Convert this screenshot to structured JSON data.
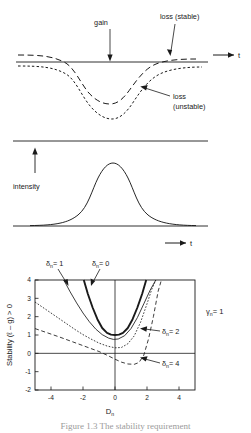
{
  "figure": {
    "caption": "Figure 1.3  The stability requirement",
    "panels": [
      "gain-loss-panel",
      "intensity-panel",
      "stability-panel"
    ]
  },
  "top_panel": {
    "name": "gain-loss-diagram",
    "axis_label_t": "t",
    "annotations": [
      {
        "id": "gain",
        "text": "gain"
      },
      {
        "id": "loss-stable",
        "text": "loss (stable)"
      },
      {
        "id": "loss-unstable-line1",
        "text": "loss"
      },
      {
        "id": "loss-unstable-line2",
        "text": "(unstable)"
      }
    ],
    "curves": [
      {
        "name": "gain-line",
        "style": "solid"
      },
      {
        "name": "loss-stable-curve",
        "style": "dashed"
      },
      {
        "name": "loss-unstable-curve",
        "style": "dotted"
      }
    ]
  },
  "mid_panel": {
    "name": "intensity-pulse-diagram",
    "y_axis_label": "intensity",
    "x_axis_label": "t",
    "curve": {
      "name": "intensity-pulse",
      "shape": "gaussian"
    }
  },
  "chart_data": {
    "type": "line",
    "title": "",
    "xlabel": "D_n",
    "ylabel": "Stability  (ℓ – g) > 0",
    "xlim": [
      -5,
      5
    ],
    "ylim": [
      -2,
      4
    ],
    "xticks": [
      -4,
      -2,
      0,
      2,
      4
    ],
    "yticks": [
      4,
      3,
      2,
      1,
      0,
      -1,
      -2
    ],
    "grid": false,
    "legend": "inline-annotations",
    "annotations": [
      {
        "id": "gamma-n",
        "text": "γ",
        "sub": "n",
        "value": "= 1",
        "x": 3.6,
        "y": 2.85
      }
    ],
    "series": [
      {
        "name": "δn = 0",
        "label": "δ",
        "sub": "n",
        "eq": "= 0",
        "style": "solid-thick",
        "x": [
          -1.95,
          -1.7,
          -1.4,
          -1.1,
          -0.8,
          -0.5,
          -0.25,
          0,
          0.25,
          0.5,
          0.8,
          1.1,
          1.4,
          1.7,
          1.95
        ],
        "y": [
          4.0,
          3.25,
          2.5,
          1.86,
          1.38,
          1.12,
          1.02,
          1.0,
          1.02,
          1.12,
          1.38,
          1.86,
          2.5,
          3.25,
          4.0
        ]
      },
      {
        "name": "δn = 1",
        "label": "δ",
        "sub": "n",
        "eq": "= 1",
        "style": "solid-thin",
        "x": [
          -3.2,
          -2.8,
          -2.4,
          -2.0,
          -1.6,
          -1.2,
          -0.8,
          -0.4,
          -0.1,
          0.2,
          0.6,
          1.0,
          1.4,
          1.8,
          2.2,
          2.55
        ],
        "y": [
          4.0,
          3.35,
          2.75,
          2.2,
          1.72,
          1.32,
          1.02,
          0.83,
          0.76,
          0.78,
          0.96,
          1.35,
          1.95,
          2.7,
          3.45,
          4.0
        ]
      },
      {
        "name": "δn = 2",
        "label": "δ",
        "sub": "n",
        "eq": "= 2",
        "style": "dotted",
        "x": [
          -5,
          -4.5,
          -4,
          -3.5,
          -3,
          -2.5,
          -2,
          -1.5,
          -1,
          -0.5,
          0,
          0.4,
          0.8,
          1.2,
          1.6,
          2.0,
          2.3,
          2.55
        ],
        "y": [
          2.8,
          2.5,
          2.2,
          1.9,
          1.6,
          1.3,
          1.02,
          0.78,
          0.56,
          0.4,
          0.3,
          0.32,
          0.52,
          0.95,
          1.7,
          2.7,
          3.5,
          4.0
        ]
      },
      {
        "name": "δn = 4",
        "label": "δ",
        "sub": "n",
        "eq": "= 4",
        "style": "dashed",
        "x": [
          -5,
          -4.5,
          -4,
          -3.5,
          -3,
          -2.5,
          -2,
          -1.5,
          -1,
          -0.5,
          0,
          0.4,
          0.8,
          1.2,
          1.5,
          1.8,
          2.1,
          2.4,
          2.7,
          2.9
        ],
        "y": [
          1.35,
          1.2,
          1.05,
          0.9,
          0.74,
          0.58,
          0.42,
          0.26,
          0.1,
          -0.1,
          -0.32,
          -0.48,
          -0.58,
          -0.6,
          -0.5,
          -0.1,
          0.8,
          2.0,
          3.4,
          4.0
        ]
      }
    ]
  }
}
